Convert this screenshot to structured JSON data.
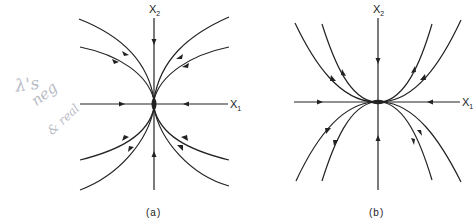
{
  "handwritten_note": {
    "line1": "λ's",
    "line2": "neg",
    "line3": "& real",
    "color": "#b9bcc6"
  },
  "figure_a": {
    "caption": "(a)",
    "x_axis_label": "X",
    "x_axis_sub": "1",
    "y_axis_label": "X",
    "y_axis_sub": "2",
    "description": "Stable node: all trajectories approach origin tangent to the x2 axis"
  },
  "figure_b": {
    "caption": "(b)",
    "x_axis_label": "X",
    "x_axis_sub": "1",
    "y_axis_label": "X",
    "y_axis_sub": "2",
    "description": "Stable node: all trajectories approach origin tangent to the x1 axis"
  },
  "colors": {
    "stroke": "#222222",
    "background": "#ffffff"
  }
}
